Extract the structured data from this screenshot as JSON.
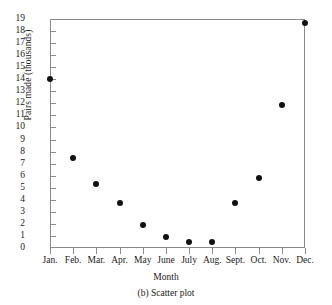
{
  "chart_data": {
    "type": "scatter",
    "title": "",
    "caption": "(b) Scatter plot",
    "xlabel": "Month",
    "ylabel": "Pairs made (thousands)",
    "categories": [
      "Jan.",
      "Feb.",
      "Mar.",
      "Apr.",
      "May",
      "June",
      "July",
      "Aug.",
      "Sept.",
      "Oct.",
      "Nov.",
      "Dec."
    ],
    "values": [
      14,
      7.5,
      5.3,
      3.7,
      1.9,
      0.9,
      0.5,
      0.5,
      3.7,
      5.8,
      11.9,
      18.7
    ],
    "ylim": [
      0,
      19
    ],
    "ytick_labels": [
      "0",
      "1",
      "2",
      "3",
      "4",
      "5",
      "6",
      "7",
      "8",
      "9",
      "10",
      "11",
      "12",
      "13",
      "14",
      "15",
      "16",
      "17",
      "18",
      "19"
    ],
    "grid": false,
    "legend": "none",
    "marker": "filled-circle",
    "marker_color": "#111111",
    "frame_color": "#8a8a8a"
  }
}
